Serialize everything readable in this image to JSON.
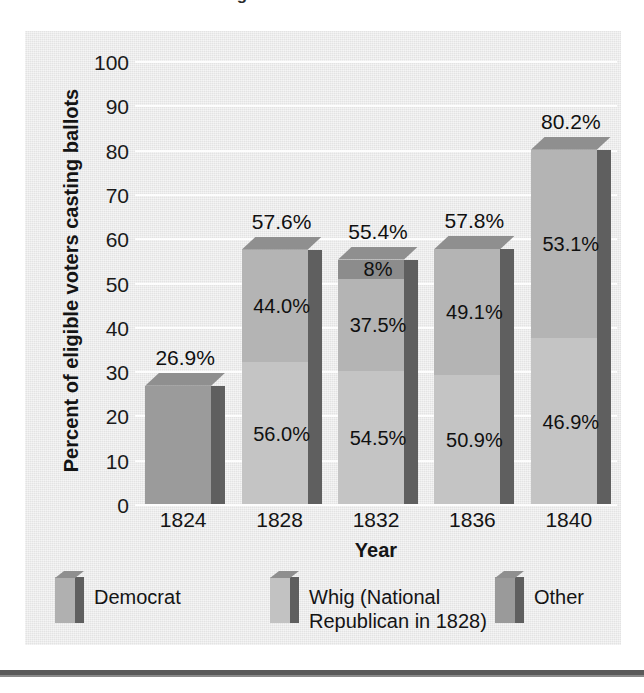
{
  "title": {
    "text": "Voting in Presidential Elections",
    "clipped": true
  },
  "chart_data": {
    "type": "bar",
    "subtype": "stacked-3d-column",
    "title": "Voting in Presidential Elections",
    "xlabel": "Year",
    "ylabel": "Percent of eligible voters casting ballots",
    "ylim": [
      0,
      100
    ],
    "ytick_step": 10,
    "yticks": [
      "100",
      "90",
      "80",
      "70",
      "60",
      "50",
      "40",
      "30",
      "20",
      "10",
      "0"
    ],
    "categories": [
      "1824",
      "1828",
      "1832",
      "1836",
      "1840"
    ],
    "totals": [
      26.9,
      57.6,
      55.4,
      57.8,
      80.2
    ],
    "total_labels": [
      "26.9%",
      "57.6%",
      "55.4%",
      "57.8%",
      "80.2%"
    ],
    "grid": true,
    "legend_position": "bottom",
    "series": [
      {
        "name": "Democrat",
        "values": [
          100,
          56.0,
          54.5,
          50.9,
          46.9
        ]
      },
      {
        "name": "Whig (National Republican in 1828)",
        "values": [
          0,
          44.0,
          37.5,
          49.1,
          53.1
        ]
      },
      {
        "name": "Other",
        "values": [
          0,
          0,
          8,
          0,
          0
        ]
      }
    ],
    "bars": [
      {
        "category": "1824",
        "total": 26.9,
        "total_label": "26.9%",
        "segments": [
          {
            "series": "Democrat",
            "share": 100,
            "label": "",
            "color": "#9b9b9b"
          }
        ]
      },
      {
        "category": "1828",
        "total": 57.6,
        "total_label": "57.6%",
        "segments": [
          {
            "series": "Democrat",
            "share": 56.0,
            "label": "56.0%",
            "color": "#c4c4c4"
          },
          {
            "series": "Whig (National Republican in 1828)",
            "share": 44.0,
            "label": "44.0%",
            "color": "#b4b4b4"
          }
        ]
      },
      {
        "category": "1832",
        "total": 55.4,
        "total_label": "55.4%",
        "segments": [
          {
            "series": "Democrat",
            "share": 54.5,
            "label": "54.5%",
            "color": "#c4c4c4"
          },
          {
            "series": "Whig (National Republican in 1828)",
            "share": 37.5,
            "label": "37.5%",
            "color": "#b4b4b4"
          },
          {
            "series": "Other",
            "share": 8,
            "label": "8%",
            "color": "#8c8c8c"
          }
        ]
      },
      {
        "category": "1836",
        "total": 57.8,
        "total_label": "57.8%",
        "segments": [
          {
            "series": "Democrat",
            "share": 50.9,
            "label": "50.9%",
            "color": "#c4c4c4"
          },
          {
            "series": "Whig (National Republican in 1828)",
            "share": 49.1,
            "label": "49.1%",
            "color": "#b4b4b4"
          }
        ]
      },
      {
        "category": "1840",
        "total": 80.2,
        "total_label": "80.2%",
        "segments": [
          {
            "series": "Democrat",
            "share": 46.9,
            "label": "46.9%",
            "color": "#c4c4c4"
          },
          {
            "series": "Whig (National Republican in 1828)",
            "share": 53.1,
            "label": "53.1%",
            "color": "#b4b4b4"
          }
        ]
      }
    ],
    "legend": [
      {
        "label": "Democrat",
        "color": "#b0b0b0"
      },
      {
        "label": "Whig (National\nRepublican in 1828)",
        "color": "#c2c2c2"
      },
      {
        "label": "Other",
        "color": "#9a9a9a"
      }
    ],
    "colors": {
      "panel": "#e9e9e9",
      "gridline": "#fdfdfd",
      "democrat": "#c4c4c4",
      "democrat_1824": "#9b9b9b",
      "whig": "#b4b4b4",
      "other": "#8c8c8c",
      "side_shadow": "#5f5f5f",
      "top_face": "#8f8f8f",
      "text": "#141414"
    }
  }
}
